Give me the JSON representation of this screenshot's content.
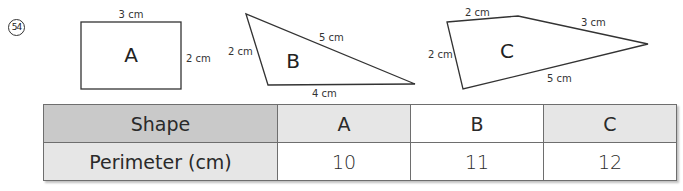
{
  "question": {
    "number": "54"
  },
  "shapes": [
    {
      "name": "A",
      "type": "rectangle",
      "side_labels": {
        "top": "3 cm",
        "right": "2 cm"
      }
    },
    {
      "name": "B",
      "type": "triangle",
      "side_labels": {
        "left": "2 cm",
        "hypotenuse": "5 cm",
        "bottom": "4 cm"
      }
    },
    {
      "name": "C",
      "type": "quadrilateral",
      "side_labels": {
        "top_left": "2 cm",
        "top_right": "3 cm",
        "left": "2 cm",
        "bottom": "5 cm"
      }
    }
  ],
  "table": {
    "header": [
      "Shape",
      "A",
      "B",
      "C"
    ],
    "row": [
      "Perimeter (cm)",
      "10",
      "11",
      "12"
    ]
  }
}
